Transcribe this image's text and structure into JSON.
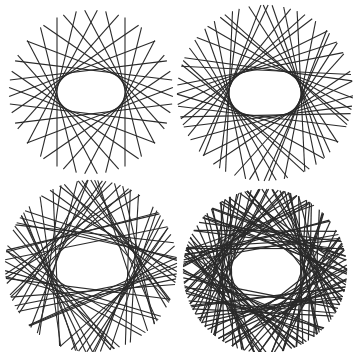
{
  "figure": {
    "background": "#ffffff",
    "line_color": "#2a2a2a",
    "panels": [
      {
        "id": "top-left",
        "cx": 91,
        "cy": 92,
        "outer_r": 82,
        "hole_w": 68,
        "hole_h": 40,
        "lines": 26,
        "jitter": 0.0,
        "stroke": 1.1,
        "extend": 1.0
      },
      {
        "id": "top-right",
        "cx": 265,
        "cy": 93,
        "outer_r": 88,
        "hole_w": 72,
        "hole_h": 44,
        "lines": 40,
        "jitter": 0.25,
        "stroke": 1.1,
        "extend": 1.0
      },
      {
        "id": "bottom-left",
        "cx": 91,
        "cy": 266,
        "outer_r": 86,
        "hole_w": 68,
        "hole_h": 40,
        "lines": 60,
        "jitter": 0.9,
        "stroke": 1.1,
        "extend": 1.0
      },
      {
        "id": "bottom-right",
        "cx": 265,
        "cy": 271,
        "outer_r": 82,
        "hole_w": 66,
        "hole_h": 40,
        "lines": 110,
        "jitter": 1.2,
        "stroke": 1.2,
        "extend": 1.0
      }
    ]
  }
}
